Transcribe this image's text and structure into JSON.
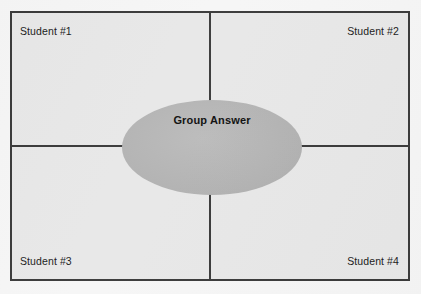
{
  "diagram": {
    "frame": {
      "border_color": "#3b3b3b",
      "fill_color": "#e8e8e8"
    },
    "quadrants": [
      {
        "id": "top-left",
        "label": "Student #1"
      },
      {
        "id": "top-right",
        "label": "Student #2"
      },
      {
        "id": "bottom-left",
        "label": "Student #3"
      },
      {
        "id": "bottom-right",
        "label": "Student #4"
      }
    ],
    "center": {
      "label": "Group Answer",
      "shape": "ellipse",
      "fill_color": "#b5b5b5"
    },
    "page_background": "#f6f6f6"
  }
}
